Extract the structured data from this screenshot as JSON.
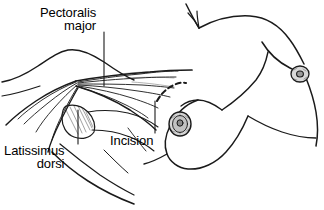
{
  "figure": {
    "background_color": "#ffffff",
    "ink_color": "#1a1a1a",
    "width": 324,
    "height": 210
  },
  "labels": {
    "pectoralis": {
      "line1": "Pectoralis",
      "line2": "major"
    },
    "latissimus": {
      "line1": "Latissimus",
      "line2": "dorsi"
    },
    "incision": {
      "text": "Incision"
    }
  },
  "anatomy": {
    "parts": [
      "torso-outline",
      "shoulder-contour",
      "pectoralis-major-muscle-fibers",
      "latissimus-dorsi-muscle-fibers",
      "near-breast-outline",
      "far-breast-outline",
      "near-areola",
      "far-areola",
      "incision-dashed-arc",
      "arm-fold"
    ]
  },
  "leaders": {
    "pectoralis_leader": "vertical-line",
    "latissimus_leader": "vertical-line",
    "incision_leader": "vertical-line"
  }
}
